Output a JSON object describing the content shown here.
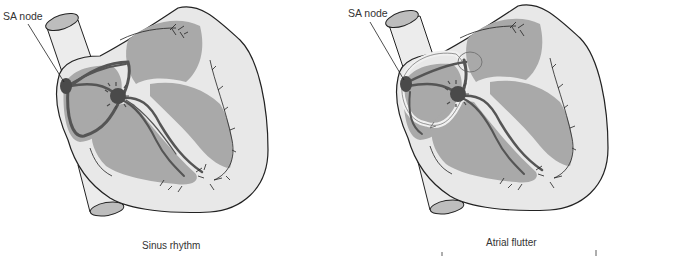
{
  "figure": {
    "panels": [
      {
        "id": "sinus",
        "caption": "Sinus rhythm",
        "callout": "SA node"
      },
      {
        "id": "flutter",
        "caption": "Atrial flutter",
        "callout": "SA node"
      }
    ],
    "colors": {
      "outline": "#222222",
      "wall": "#e6e6e6",
      "chamber": "#a9a9a9",
      "conduction": "#555555",
      "node": "#4a4a4a",
      "reentry_loop": "#f0f0f0"
    }
  }
}
